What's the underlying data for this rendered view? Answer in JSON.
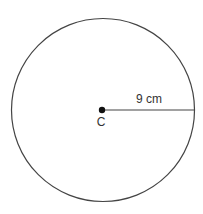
{
  "diagram": {
    "shape": "circle",
    "center": {
      "label": "C"
    },
    "radius": {
      "label": "9 cm",
      "value": 9,
      "unit": "cm"
    },
    "colors": {
      "stroke": "#444444",
      "point": "#111111",
      "text": "#333333"
    }
  }
}
